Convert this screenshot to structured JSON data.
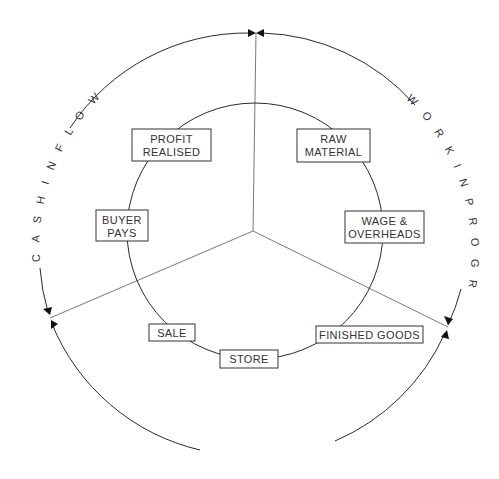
{
  "diagram": {
    "outer_cycle": {
      "labels": {
        "work_in_progress": "W O R K   I N   P R O G R E S S",
        "finished_goods": "FINISHED GOODS",
        "cash_inflow": "C A S H   I N F L O W"
      }
    },
    "inner_cycle": {
      "nodes": [
        {
          "id": "raw-material",
          "line1": "RAW",
          "line2": "MATERIAL"
        },
        {
          "id": "wage-overheads",
          "line1": "WAGE &",
          "line2": "OVERHEADS"
        },
        {
          "id": "finished-goods",
          "line1": "FINISHED GOODS",
          "line2": ""
        },
        {
          "id": "store",
          "line1": "STORE",
          "line2": ""
        },
        {
          "id": "sale",
          "line1": "SALE",
          "line2": ""
        },
        {
          "id": "buyer-pays",
          "line1": "BUYER",
          "line2": "PAYS"
        },
        {
          "id": "profit-realised",
          "line1": "PROFIT",
          "line2": "REALISED"
        }
      ]
    },
    "colors": {
      "line": "#2a2a2a",
      "background": "#ffffff"
    }
  }
}
